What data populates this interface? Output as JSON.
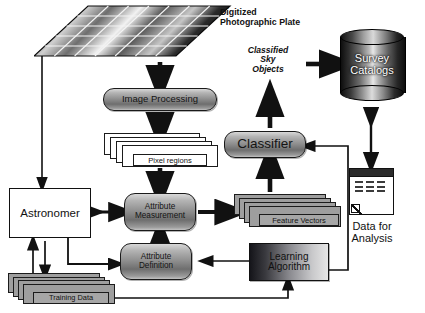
{
  "diagram": {
    "colors": {
      "stroke": "#111111",
      "node_fill_light": "#d8d8d8",
      "node_fill_dark": "#6e6e6e",
      "sheet_gray": "#9e9e9e",
      "background": "#ffffff"
    }
  },
  "nodes": {
    "plate_label_line1": "Digitized",
    "plate_label_line2": "Photographic Plate",
    "image_processing": "Image Processing",
    "pixel_regions": "Pixel regions",
    "astronomer": "Astronomer",
    "attribute_measurement_line1": "Attribute",
    "attribute_measurement_line2": "Measurement",
    "attribute_definition_line1": "Attribute",
    "attribute_definition_line2": "Definition",
    "feature_vectors": "Feature Vectors",
    "training_data": "Training Data",
    "learning_algorithm_line1": "Learning",
    "learning_algorithm_line2": "Algorithm",
    "classifier": "Classifier",
    "classified_sky_objects_line1": "Classified",
    "classified_sky_objects_line2": "Sky",
    "classified_sky_objects_line3": "Objects",
    "survey_catalogs_line1": "Survey",
    "survey_catalogs_line2": "Catalogs",
    "data_for_analysis_line1": "Data for",
    "data_for_analysis_line2": "Analysis"
  },
  "plate": {
    "rows": 5,
    "cols": 7
  },
  "doc_icon": {
    "rows": 3,
    "dashes_per_row": 3
  }
}
